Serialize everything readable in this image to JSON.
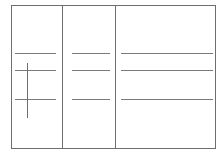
{
  "diagram": {
    "type": "form-layout-wireframe",
    "columns": 3,
    "colors": {
      "border": "#6e6e6e",
      "line": "#7a7a7a",
      "background": "#ffffff"
    },
    "rows": [
      {
        "y": 53
      },
      {
        "y": 70
      },
      {
        "y": 99
      }
    ],
    "cursor_marker": {
      "x": 27,
      "y_start": 63,
      "y_end": 118
    }
  }
}
